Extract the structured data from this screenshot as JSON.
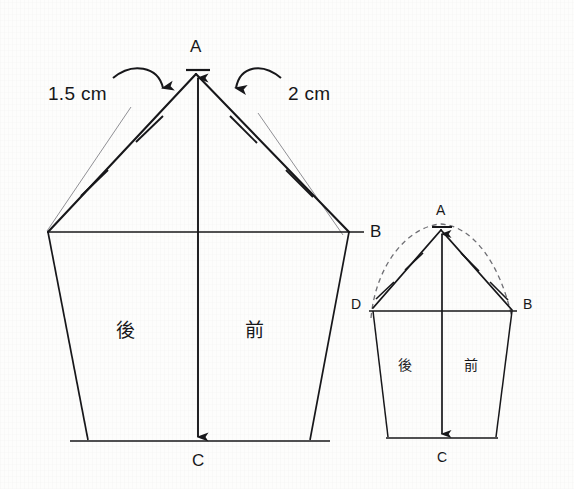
{
  "diagram": {
    "background_color": "#fdfdfc",
    "ink_color": "#17171a",
    "guide_color": "#8a8a8f",
    "dashed_color": "#6f6f74"
  },
  "main_figure": {
    "name": "large-pattern-piece",
    "apex_label": "A",
    "waist_right_label": "B",
    "hem_label": "C",
    "back_panel_label": "後",
    "front_panel_label": "前",
    "left_dimension": "1.5 cm",
    "right_dimension": "2 cm",
    "tick_count_left": 2,
    "tick_count_right": 2
  },
  "small_figure": {
    "name": "small-pattern-piece",
    "apex_label": "A",
    "waist_left_label": "D",
    "waist_right_label": "B",
    "hem_label": "C",
    "back_panel_label": "後",
    "front_panel_label": "前",
    "tick_count_left": 2,
    "tick_count_right": 2,
    "has_dashed_arc": true
  }
}
